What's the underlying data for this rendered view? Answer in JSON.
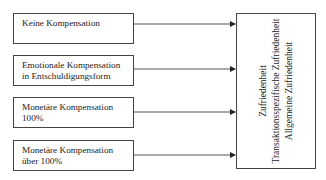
{
  "inputs": [
    {
      "lines": [
        "Keine Kompensation",
        ""
      ]
    },
    {
      "lines": [
        "Emotionale Kompensation",
        "in Entschuldigungsform"
      ]
    },
    {
      "lines": [
        "Monetäre Kompensation",
        "100%"
      ]
    },
    {
      "lines": [
        "Monetäre Kompensation",
        "über 100%"
      ]
    }
  ],
  "target": {
    "lines": [
      "Zufriedenheit",
      "Transaktionsspezifische Zufriedenheit",
      "Allgemeine Zufriedenheit"
    ]
  },
  "colors": {
    "line": "#444444",
    "text": "#222222",
    "background": "#ffffff"
  }
}
